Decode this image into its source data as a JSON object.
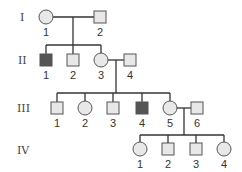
{
  "diagram": {
    "type": "pedigree",
    "colors": {
      "unaffected_fill": "#e8e8e8",
      "affected_fill": "#555555",
      "line": "#333333"
    },
    "generations": [
      {
        "label": "I",
        "y": 17
      },
      {
        "label": "II",
        "y": 60
      },
      {
        "label": "III",
        "y": 108
      },
      {
        "label": "IV",
        "y": 149
      }
    ],
    "individuals": {
      "I-1": {
        "label": "1",
        "sex": "female",
        "affected": false
      },
      "I-2": {
        "label": "2",
        "sex": "male",
        "affected": false
      },
      "II-1": {
        "label": "1",
        "sex": "male",
        "affected": true
      },
      "II-2": {
        "label": "2",
        "sex": "male",
        "affected": false
      },
      "II-3": {
        "label": "3",
        "sex": "female",
        "affected": false
      },
      "II-4": {
        "label": "4",
        "sex": "male",
        "affected": false
      },
      "III-1": {
        "label": "1",
        "sex": "male",
        "affected": false
      },
      "III-2": {
        "label": "2",
        "sex": "female",
        "affected": false
      },
      "III-3": {
        "label": "3",
        "sex": "male",
        "affected": false
      },
      "III-4": {
        "label": "4",
        "sex": "male",
        "affected": true
      },
      "III-5": {
        "label": "5",
        "sex": "female",
        "affected": false
      },
      "III-6": {
        "label": "6",
        "sex": "male",
        "affected": false
      },
      "IV-1": {
        "label": "1",
        "sex": "female",
        "affected": false
      },
      "IV-2": {
        "label": "2",
        "sex": "male",
        "affected": false
      },
      "IV-3": {
        "label": "3",
        "sex": "male",
        "affected": false
      },
      "IV-4": {
        "label": "4",
        "sex": "female",
        "affected": false
      }
    },
    "matings": [
      {
        "partners": [
          "I-1",
          "I-2"
        ],
        "children": [
          "II-1",
          "II-2",
          "II-3"
        ]
      },
      {
        "partners": [
          "II-3",
          "II-4"
        ],
        "children": [
          "III-1",
          "III-2",
          "III-3",
          "III-4",
          "III-5"
        ]
      },
      {
        "partners": [
          "III-5",
          "III-6"
        ],
        "children": [
          "IV-1",
          "IV-2",
          "IV-3",
          "IV-4"
        ]
      }
    ]
  }
}
